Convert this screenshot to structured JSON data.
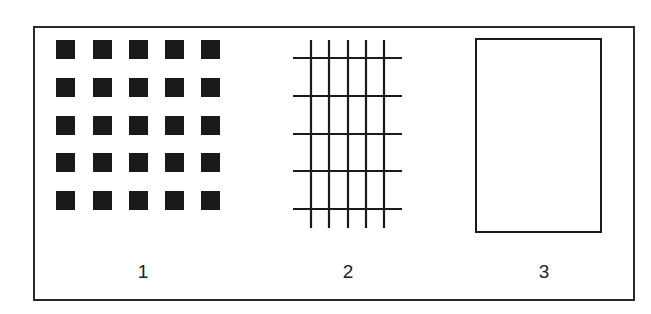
{
  "figure": {
    "panels": [
      {
        "id": "panel-1",
        "label": "1",
        "kind": "square-dot-array",
        "rows": 5,
        "cols": 5
      },
      {
        "id": "panel-2",
        "label": "2",
        "kind": "line-grid",
        "vertical_lines": 5,
        "horizontal_lines": 5
      },
      {
        "id": "panel-3",
        "label": "3",
        "kind": "empty-rectangle"
      }
    ],
    "colors": {
      "ink": "#1a1a1a",
      "background": "#ffffff"
    }
  }
}
